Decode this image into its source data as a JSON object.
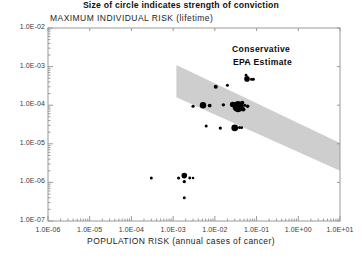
{
  "chart_data": {
    "type": "scatter",
    "title": "MAXIMUM INDIVIDUAL RISK (lifetime)",
    "xlabel": "POPULATION RISK (annual cases of cancer)",
    "ylabel": "MAXIMUM INDIVIDUAL RISK (lifetime)",
    "caption": "Size of circle indicates strength of conviction",
    "xscale": "log",
    "yscale": "log",
    "xlim": [
      1e-06,
      10
    ],
    "ylim": [
      1e-07,
      0.01
    ],
    "grid": false,
    "legend": null,
    "xtick_labels": [
      "1.0E-06",
      "1.0E-05",
      "1.0E-04",
      "1.0E-03",
      "1.0E-02",
      "1.0E-01",
      "1.0E+00",
      "1.0E+01"
    ],
    "xtick_values": [
      1e-06,
      1e-05,
      0.0001,
      0.001,
      0.01,
      0.1,
      1,
      10
    ],
    "ytick_labels": [
      "1.0E-02",
      "1.0E-03",
      "1.0E-04",
      "1.0E-05",
      "1.0E-06",
      "1.0E-07"
    ],
    "ytick_values": [
      0.01,
      0.001,
      0.0001,
      1e-05,
      1e-06,
      1e-07
    ],
    "minor_ticks": true,
    "annotations": [
      {
        "text": "Conservative",
        "x": 0.06,
        "y": 0.0016
      },
      {
        "text": "EPA Estimate",
        "x": 0.06,
        "y": 0.0008
      }
    ],
    "band": {
      "label": "Conservative EPA Estimate band",
      "color": "#c6c6c6",
      "opacity": 0.85,
      "upper": [
        [
          0.0012,
          0.0011
        ],
        [
          10,
          1.05e-05
        ]
      ],
      "lower": [
        [
          0.0012,
          0.00016
        ],
        [
          10,
          2e-06
        ]
      ]
    },
    "series": [
      {
        "name": "risk estimates",
        "marker": "circle",
        "color": "#000000",
        "size_meaning": "Size of circle indicates strength of conviction",
        "points": [
          {
            "x": 0.003,
            "y": 9.4e-05,
            "r": 1.6
          },
          {
            "x": 0.0052,
            "y": 0.0001,
            "r": 3.2
          },
          {
            "x": 0.0075,
            "y": 9.8e-05,
            "r": 1.9
          },
          {
            "x": 0.0105,
            "y": 0.0003,
            "r": 2.0
          },
          {
            "x": 0.016,
            "y": 0.000102,
            "r": 1.7
          },
          {
            "x": 0.02,
            "y": 0.00033,
            "r": 1.5
          },
          {
            "x": 0.0265,
            "y": 0.000105,
            "r": 2.6
          },
          {
            "x": 0.031,
            "y": 9.8e-05,
            "r": 3.0
          },
          {
            "x": 0.036,
            "y": 9.2e-05,
            "r": 5.6
          },
          {
            "x": 0.042,
            "y": 8.6e-05,
            "r": 2.4
          },
          {
            "x": 0.0455,
            "y": 0.000115,
            "r": 2.0
          },
          {
            "x": 0.048,
            "y": 7.8e-05,
            "r": 2.2
          },
          {
            "x": 0.052,
            "y": 0.0001,
            "r": 1.5
          },
          {
            "x": 0.061,
            "y": 9.4e-05,
            "r": 1.8
          },
          {
            "x": 0.056,
            "y": 0.0006,
            "r": 1.4
          },
          {
            "x": 0.059,
            "y": 0.00048,
            "r": 2.8
          },
          {
            "x": 0.076,
            "y": 0.00047,
            "r": 1.6
          },
          {
            "x": 0.084,
            "y": 0.00047,
            "r": 1.5
          },
          {
            "x": 0.056,
            "y": 0.0013,
            "r": 1.0
          },
          {
            "x": 0.0062,
            "y": 2.9e-05,
            "r": 1.5
          },
          {
            "x": 0.0135,
            "y": 2.55e-05,
            "r": 1.6
          },
          {
            "x": 0.03,
            "y": 2.6e-05,
            "r": 3.4
          },
          {
            "x": 0.039,
            "y": 2.65e-05,
            "r": 1.5
          },
          {
            "x": 0.044,
            "y": 2.62e-05,
            "r": 1.4
          },
          {
            "x": 0.0003,
            "y": 1.3e-06,
            "r": 1.5
          },
          {
            "x": 0.00135,
            "y": 1.3e-06,
            "r": 1.6
          },
          {
            "x": 0.00185,
            "y": 1.5e-06,
            "r": 2.8
          },
          {
            "x": 0.00185,
            "y": 1.05e-06,
            "r": 1.7
          },
          {
            "x": 0.0025,
            "y": 1.3e-06,
            "r": 1.4
          },
          {
            "x": 0.003,
            "y": 1.3e-06,
            "r": 1.3
          },
          {
            "x": 0.00185,
            "y": 4e-07,
            "r": 1.5
          }
        ]
      }
    ]
  },
  "axes": {
    "title": "MAXIMUM INDIVIDUAL RISK (lifetime)",
    "xlabel": "POPULATION RISK (annual cases of cancer)",
    "caption": "Size of circle indicates strength of conviction"
  }
}
